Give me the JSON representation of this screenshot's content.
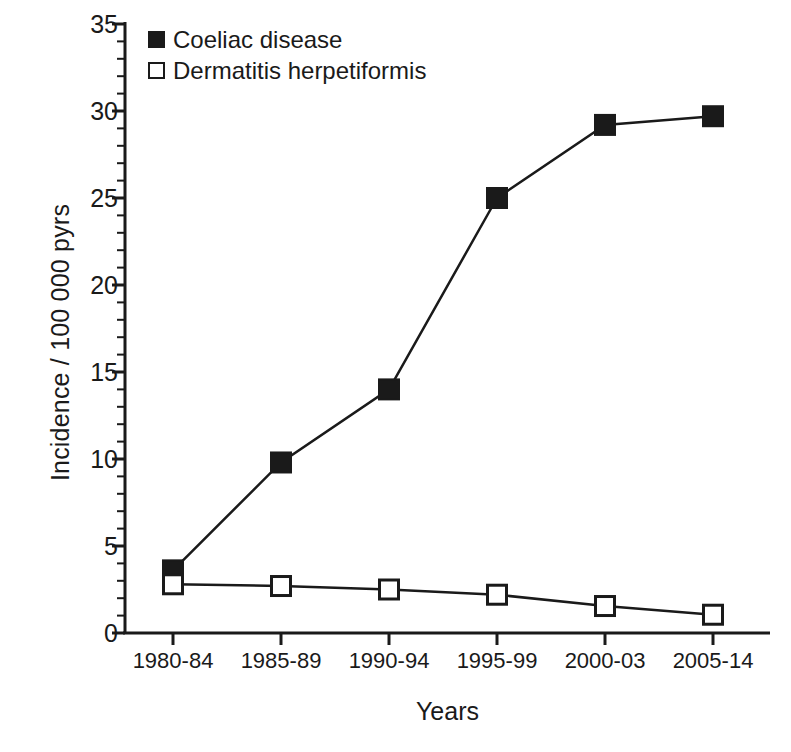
{
  "chart_data": {
    "type": "line",
    "title": "",
    "subtitle": "",
    "xlabel": "Years",
    "ylabel": "Incidence / 100 000 pyrs",
    "categories": [
      "1980-84",
      "1985-89",
      "1990-94",
      "1995-99",
      "2000-03",
      "2005-14"
    ],
    "series": [
      {
        "name": "Coeliac disease",
        "marker": "filled-square",
        "values": [
          3.6,
          9.8,
          14.0,
          25.0,
          29.2,
          29.7
        ]
      },
      {
        "name": "Dermatitis herpetiformis",
        "marker": "open-square",
        "values": [
          2.8,
          2.7,
          2.5,
          2.2,
          1.55,
          1.05
        ]
      }
    ],
    "ylim": [
      0,
      35
    ],
    "ytick_labels": [
      "0",
      "5",
      "10",
      "15",
      "20",
      "25",
      "30",
      "35"
    ],
    "ytick_values": [
      0,
      5,
      10,
      15,
      20,
      25,
      30,
      35
    ],
    "yminor_step": 1,
    "grid": false,
    "legend_position": "top-left",
    "line_color": "#1a1a1a",
    "background_color": "#ffffff"
  },
  "legend": {
    "items": [
      {
        "label": "Coeliac disease",
        "marker": "filled-square"
      },
      {
        "label": "Dermatitis herpetiformis",
        "marker": "open-square"
      }
    ]
  },
  "axes": {
    "y_title": "Incidence / 100 000 pyrs",
    "x_title": "Years"
  }
}
